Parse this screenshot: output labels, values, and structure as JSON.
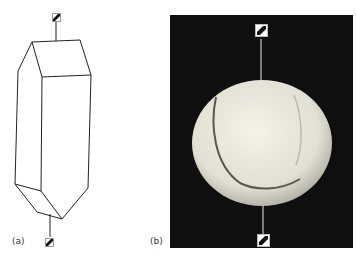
{
  "figure": {
    "panels": [
      {
        "id": "a",
        "label": "(a)",
        "content": "prism wireframe with axis markers"
      },
      {
        "id": "b",
        "label": "(b)",
        "content": "tennis ball photograph with axis markers"
      }
    ],
    "colors": {
      "background": "#ffffff",
      "line": "#222222",
      "photo_background": "#0f0f0f",
      "ball": "#e9e6dc"
    }
  }
}
